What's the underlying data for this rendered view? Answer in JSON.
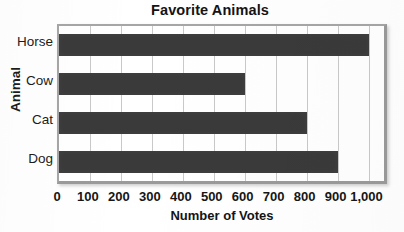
{
  "chart_data": {
    "type": "bar",
    "orientation": "horizontal",
    "title": "Favorite Animals",
    "xlabel": "Number of Votes",
    "ylabel": "Animal",
    "categories": [
      "Horse",
      "Cow",
      "Cat",
      "Dog"
    ],
    "values": [
      1000,
      600,
      800,
      900
    ],
    "xlim": [
      0,
      1050
    ],
    "xticks": [
      0,
      100,
      200,
      300,
      400,
      500,
      600,
      700,
      800,
      900,
      1000
    ],
    "xtick_labels": [
      "0",
      "100",
      "200",
      "300",
      "400",
      "500",
      "600",
      "700",
      "800",
      "900",
      "1,000"
    ],
    "grid": "vertical",
    "legend": "none",
    "bar_color": "#3a3a3a",
    "frame_color": "#a6a6a6",
    "gridline_color": "#c9c9c9",
    "background_color": "#ffffff"
  }
}
